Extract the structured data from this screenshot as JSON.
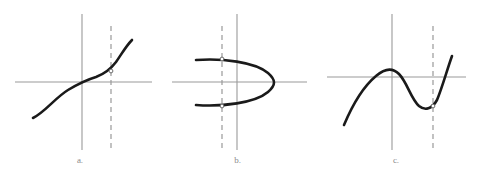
{
  "figure": {
    "width": 477,
    "height": 178,
    "background": "#ffffff",
    "axis_color": "#9a9a9a",
    "curve_color": "#1a1a1a",
    "dashed_color": "#999999",
    "label_color": "#8a8a8a"
  },
  "panels": [
    {
      "id": "a",
      "label": "a.",
      "curve_type": "cubic",
      "passes_vertical_line_test": true,
      "intersection_count": 1,
      "description": "Increasing cubic curve with inflection near origin; the dashed vertical line meets the curve at exactly one point.",
      "axes": {
        "x_axis": {
          "y": 82,
          "x_start": 15,
          "x_end": 152
        },
        "y_axis": {
          "x": 82,
          "y_start": 14,
          "y_end": 150
        }
      },
      "dashed_line": {
        "x": 111,
        "y_start": 26,
        "y_end": 150
      },
      "curve_points": "M 33,118 C 45,112 55,98 68,90 C 78,84 86,80 96,77 C 104,74 110,70 116,62 C 121,55 126,46 132,40",
      "markers": [
        {
          "x": 111,
          "y": 71
        }
      ]
    },
    {
      "id": "b",
      "label": "b.",
      "curve_type": "sideways-parabola",
      "passes_vertical_line_test": false,
      "intersection_count": 2,
      "description": "Parabola opening to the left with vertex on the x-axis at right; the dashed vertical line meets the curve at two points.",
      "axes": {
        "x_axis": {
          "y": 82,
          "x_start": 172,
          "x_end": 307
        },
        "y_axis": {
          "x": 237,
          "y_start": 14,
          "y_end": 150
        }
      },
      "dashed_line": {
        "x": 222,
        "y_start": 26,
        "y_end": 150
      },
      "curve_points": "M 196,60 C 222,58 255,62 268,73 C 276,80 276,85 268,92 C 255,103 222,107 196,105",
      "markers": [
        {
          "x": 222,
          "y": 59
        },
        {
          "x": 222,
          "y": 106
        }
      ]
    },
    {
      "id": "c",
      "label": "c.",
      "curve_type": "cubic",
      "passes_vertical_line_test": true,
      "intersection_count": 1,
      "description": "Cubic with a local maximum and a local minimum; the dashed vertical line touches the curve at its local minimum only.",
      "axes": {
        "x_axis": {
          "y": 77,
          "x_start": 327,
          "x_end": 466
        },
        "y_axis": {
          "x": 392,
          "y_start": 14,
          "y_end": 150
        }
      },
      "dashed_line": {
        "x": 433,
        "y_start": 26,
        "y_end": 150
      },
      "curve_points": "M 344,125 C 352,106 364,86 376,76 C 384,69 392,67 399,74 C 407,82 411,99 419,106 C 425,111 432,109 437,100 C 442,88 447,70 452,56",
      "markers": [
        {
          "x": 433,
          "y": 106
        }
      ]
    }
  ]
}
